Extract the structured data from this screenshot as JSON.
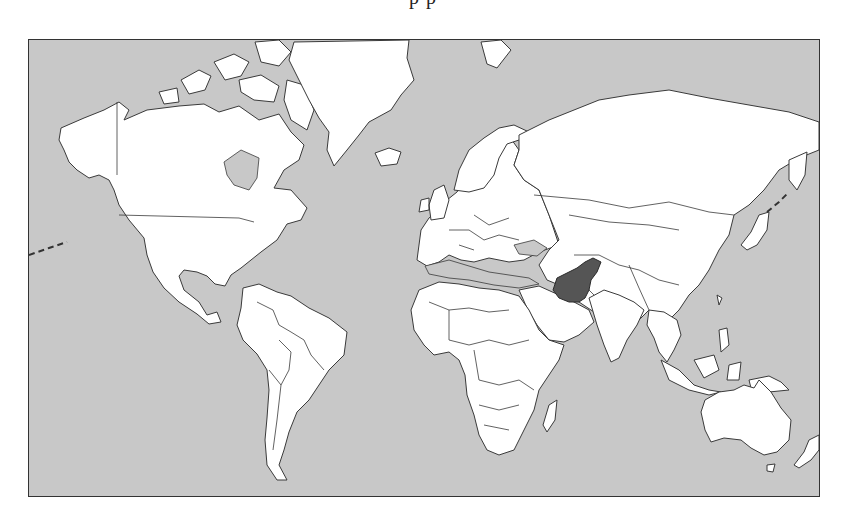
{
  "title_fragment": "p                              p",
  "map": {
    "type": "world-political-outline",
    "projection": "Mercator",
    "highlighted_country": "Pakistan",
    "colors": {
      "ocean": "#c8c8c8",
      "land": "#ffffff",
      "highlight": "#555555",
      "border": "#3a3a3a",
      "frame": "#333333"
    },
    "regions": [
      "North America",
      "Greenland",
      "South America",
      "Europe",
      "Africa",
      "Asia",
      "Australia",
      "New Zealand"
    ]
  }
}
